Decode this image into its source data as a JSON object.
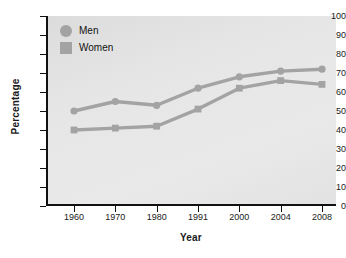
{
  "chart_data": {
    "type": "line",
    "title": "",
    "xlabel": "Year",
    "ylabel": "Percentage",
    "categories": [
      "1960",
      "1970",
      "1980",
      "1991",
      "2000",
      "2004",
      "2008"
    ],
    "series": [
      {
        "name": "Men",
        "marker": "circle",
        "color": "#a3a3a3",
        "values": [
          50,
          55,
          53,
          62,
          68,
          71,
          72
        ]
      },
      {
        "name": "Women",
        "marker": "square",
        "color": "#a3a3a3",
        "values": [
          40,
          41,
          42,
          51,
          62,
          66,
          64
        ]
      }
    ],
    "ylim": [
      0,
      100
    ],
    "yticks": [
      "0",
      "10",
      "20",
      "30",
      "40",
      "50",
      "60",
      "70",
      "80",
      "90",
      "100"
    ],
    "grid": false,
    "legend_position": "top-left"
  },
  "legend": {
    "items": [
      {
        "label": "Men",
        "marker": "circle"
      },
      {
        "label": "Women",
        "marker": "square"
      }
    ]
  },
  "axes": {
    "x_title": "Year",
    "y_title": "Percentage"
  }
}
